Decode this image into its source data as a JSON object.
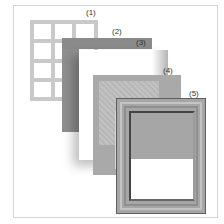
{
  "diagram": {
    "type": "exploded-view",
    "labels": [
      {
        "id": "1",
        "text": "(1)"
      },
      {
        "id": "2",
        "text": "(2)"
      },
      {
        "id": "3",
        "text": "(3)"
      },
      {
        "id": "4",
        "text": "(4)"
      },
      {
        "id": "5",
        "text": "(5)"
      }
    ],
    "layers": [
      {
        "id": "1",
        "shape": "window-grid",
        "color": "#c9c9c9",
        "columns": 3,
        "rows": 4
      },
      {
        "id": "2",
        "shape": "L-bar",
        "color": "#8e8e8e"
      },
      {
        "id": "3",
        "shape": "white-sheet",
        "color": "#ffffff"
      },
      {
        "id": "4",
        "shape": "textured-mat",
        "color": "#a9a9a9"
      },
      {
        "id": "5",
        "shape": "frame",
        "color": "#a6a6a6",
        "outline": "#5e5e5e"
      }
    ],
    "border_color": "#d4d4d4"
  }
}
